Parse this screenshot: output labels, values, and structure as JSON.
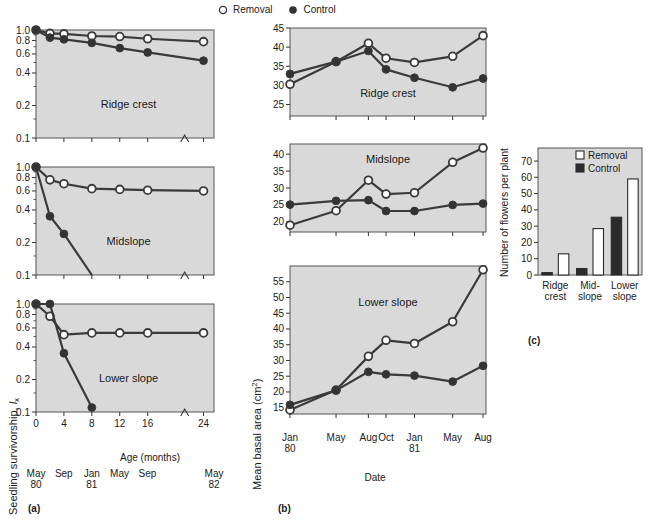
{
  "figure": {
    "legend": {
      "removal_label": "Removal",
      "control_label": "Control"
    },
    "panel_labels": {
      "a": "(a)",
      "b": "(b)",
      "c": "(c)"
    }
  },
  "chart_data": [
    {
      "id": "panel-a-ridge-crest",
      "type": "line",
      "title": "Ridge crest",
      "xlabel": "Age (months)",
      "ylabel": "Seedling survivorship, lx",
      "yscale": "log",
      "ylim": [
        0.1,
        1.0
      ],
      "yticks": [
        "1.0",
        "0.8",
        "0.6",
        "0.4",
        "0.2",
        "0.1"
      ],
      "ytickvals": [
        1.0,
        0.8,
        0.6,
        0.4,
        0.2,
        0.1
      ],
      "xticks": [
        "0",
        "4",
        "8",
        "12",
        "16",
        "24"
      ],
      "xtickvals": [
        0,
        4,
        8,
        12,
        16,
        24
      ],
      "x": [
        0,
        2,
        4,
        8,
        12,
        16,
        24
      ],
      "series": [
        {
          "name": "Removal",
          "values": [
            1.0,
            0.93,
            0.92,
            0.88,
            0.87,
            0.83,
            0.78
          ]
        },
        {
          "name": "Control",
          "values": [
            1.0,
            0.85,
            0.82,
            0.76,
            0.68,
            0.62,
            0.52
          ]
        }
      ]
    },
    {
      "id": "panel-a-midslope",
      "type": "line",
      "title": "Midslope",
      "xlabel": "Age (months)",
      "yscale": "log",
      "ylim": [
        0.1,
        1.0
      ],
      "yticks": [
        "1.0",
        "0.8",
        "0.6",
        "0.4",
        "0.2",
        "0.1"
      ],
      "ytickvals": [
        1.0,
        0.8,
        0.6,
        0.4,
        0.2,
        0.1
      ],
      "xticks": [
        "0",
        "4",
        "8",
        "12",
        "16",
        "24"
      ],
      "xtickvals": [
        0,
        4,
        8,
        12,
        16,
        24
      ],
      "x": [
        0,
        2,
        4,
        8,
        12,
        16,
        24
      ],
      "series": [
        {
          "name": "Removal",
          "values": [
            1.0,
            0.76,
            0.7,
            0.63,
            0.62,
            0.61,
            0.6
          ]
        },
        {
          "name": "Control",
          "values": [
            1.0,
            0.35,
            0.24,
            0.1,
            null,
            null,
            null
          ]
        }
      ]
    },
    {
      "id": "panel-a-lower-slope",
      "type": "line",
      "title": "Lower slope",
      "xlabel": "Age (months)",
      "yscale": "log",
      "ylim": [
        0.1,
        1.0
      ],
      "yticks": [
        "1.0",
        "0.8",
        "0.6",
        "0.4",
        "0.2",
        "0.1"
      ],
      "ytickvals": [
        1.0,
        0.8,
        0.6,
        0.4,
        0.2,
        0.1
      ],
      "xticks": [
        "0",
        "4",
        "8",
        "12",
        "16",
        "24"
      ],
      "xtickvals": [
        0,
        4,
        8,
        12,
        16,
        24
      ],
      "x": [
        0,
        2,
        4,
        8,
        12,
        16,
        24
      ],
      "series": [
        {
          "name": "Removal",
          "values": [
            1.0,
            0.77,
            0.52,
            0.54,
            0.54,
            0.54,
            0.54
          ]
        },
        {
          "name": "Control",
          "values": [
            1.0,
            1.0,
            0.35,
            0.11,
            null,
            null,
            null
          ]
        }
      ]
    },
    {
      "id": "panel-b-ridge-crest",
      "type": "line",
      "title": "Ridge crest",
      "xlabel": "Date",
      "ylabel": "Mean basal area (cm2)",
      "ylim": [
        22,
        45
      ],
      "yticks": [
        "25",
        "30",
        "35",
        "40",
        "45"
      ],
      "ytickvals": [
        25,
        30,
        35,
        40,
        45
      ],
      "categories": [
        "Jan 80",
        "May",
        "Aug",
        "Oct",
        "Jan 81",
        "May",
        "Aug"
      ],
      "series": [
        {
          "name": "Removal",
          "values": [
            30.3,
            36.2,
            41.0,
            37.1,
            36.0,
            37.6,
            43.0
          ]
        },
        {
          "name": "Control",
          "values": [
            33.0,
            36.2,
            39.0,
            34.2,
            32.0,
            29.5,
            31.8
          ]
        }
      ]
    },
    {
      "id": "panel-b-midslope",
      "type": "line",
      "title": "Midslope",
      "xlabel": "Date",
      "ylabel": "Mean basal area (cm2)",
      "ylim": [
        17,
        43
      ],
      "yticks": [
        "20",
        "25",
        "30",
        "35",
        "40"
      ],
      "ytickvals": [
        20,
        25,
        30,
        35,
        40
      ],
      "categories": [
        "Jan 80",
        "May",
        "Aug",
        "Oct",
        "Jan 81",
        "May",
        "Aug"
      ],
      "series": [
        {
          "name": "Removal",
          "values": [
            19.0,
            23.3,
            32.3,
            28.2,
            28.6,
            37.6,
            41.8
          ]
        },
        {
          "name": "Control",
          "values": [
            25.1,
            26.2,
            26.4,
            23.2,
            23.2,
            25.0,
            25.4
          ]
        }
      ]
    },
    {
      "id": "panel-b-lower-slope",
      "type": "line",
      "title": "Lower slope",
      "xlabel": "Date",
      "ylabel": "Mean basal area (cm2)",
      "ylim": [
        13,
        60
      ],
      "yticks": [
        "15",
        "20",
        "25",
        "30",
        "35",
        "40",
        "45",
        "50",
        "55"
      ],
      "ytickvals": [
        15,
        20,
        25,
        30,
        35,
        40,
        45,
        50,
        55
      ],
      "categories": [
        "Jan 80",
        "May",
        "Aug",
        "Oct",
        "Jan 81",
        "May",
        "Aug"
      ],
      "series": [
        {
          "name": "Removal",
          "values": [
            14.3,
            20.6,
            31.3,
            36.4,
            35.4,
            42.3,
            58.8
          ]
        },
        {
          "name": "Control",
          "values": [
            15.9,
            20.5,
            26.4,
            25.6,
            25.2,
            23.3,
            28.3
          ]
        }
      ]
    },
    {
      "id": "panel-c-flowers",
      "type": "bar",
      "ylabel": "Number of flowers per plant",
      "ylim": [
        0,
        78
      ],
      "yticks": [
        "0",
        "10",
        "20",
        "30",
        "40",
        "50",
        "60",
        "70"
      ],
      "ytickvals": [
        0,
        10,
        20,
        30,
        40,
        50,
        60,
        70
      ],
      "categories": [
        "Ridge crest",
        "Mid- slope",
        "Lower slope"
      ],
      "category_lines": [
        [
          "Ridge",
          "crest"
        ],
        [
          "Mid-",
          "slope"
        ],
        [
          "Lower",
          "slope"
        ]
      ],
      "series": [
        {
          "name": "Control",
          "values": [
            1.5,
            4.0,
            35.5
          ]
        },
        {
          "name": "Removal",
          "values": [
            13.0,
            28.5,
            59.0
          ]
        }
      ],
      "legend": {
        "removal_label": "Removal",
        "control_label": "Control"
      }
    }
  ],
  "axes": {
    "panel_a": {
      "ylabel_main": "Seedling survivorship, ",
      "ylabel_italic": "l",
      "ylabel_sub": "x",
      "xlabel": "Age (months)",
      "date_labels": [
        {
          "top": "May",
          "bottom": "80"
        },
        {
          "top": "Sep",
          "bottom": ""
        },
        {
          "top": "Jan",
          "bottom": "81"
        },
        {
          "top": "May",
          "bottom": ""
        },
        {
          "top": "Sep",
          "bottom": ""
        },
        {
          "top": "May",
          "bottom": "82"
        }
      ]
    },
    "panel_b": {
      "ylabel_main": "Mean basal area (cm",
      "ylabel_sup": "2",
      "ylabel_end": ")",
      "xlabel": "Date",
      "date_labels": [
        {
          "top": "Jan",
          "bottom": "80"
        },
        {
          "top": "May",
          "bottom": ""
        },
        {
          "top": "Aug",
          "bottom": ""
        },
        {
          "top": "Oct",
          "bottom": ""
        },
        {
          "top": "Jan",
          "bottom": "81"
        },
        {
          "top": "May",
          "bottom": ""
        },
        {
          "top": "Aug",
          "bottom": ""
        }
      ]
    },
    "panel_c": {
      "ylabel": "Number of flowers per plant"
    }
  },
  "style": {
    "plot_bg": "#d9d9d9",
    "line_color": "#3a3a3a",
    "marker_fill_open": "#ffffff",
    "marker_fill_closed": "#333333",
    "axis_color": "#555555"
  }
}
